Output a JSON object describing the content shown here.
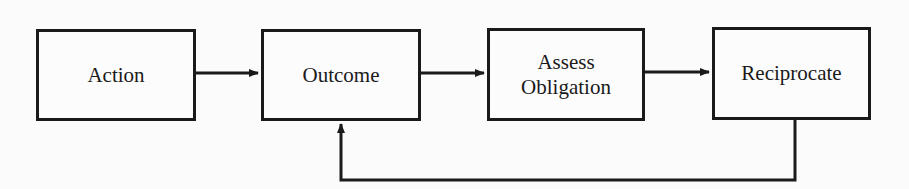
{
  "diagram": {
    "type": "flowchart",
    "nodes": [
      {
        "id": "action",
        "label": "Action"
      },
      {
        "id": "outcome",
        "label": "Outcome"
      },
      {
        "id": "assess",
        "label": "Assess\nObligation"
      },
      {
        "id": "reciprocate",
        "label": "Reciprocate"
      }
    ],
    "edges": [
      {
        "from": "action",
        "to": "outcome"
      },
      {
        "from": "outcome",
        "to": "assess"
      },
      {
        "from": "assess",
        "to": "reciprocate"
      },
      {
        "from": "reciprocate",
        "to": "outcome",
        "route": "feedback-below"
      }
    ],
    "colors": {
      "stroke": "#1a1a1a",
      "background": "#fbfbfb"
    }
  }
}
